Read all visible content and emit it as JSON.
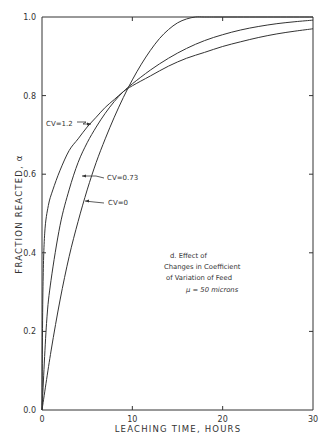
{
  "chart_data": {
    "type": "line",
    "title": "",
    "xlabel": "LEACHING TIME, HOURS",
    "ylabel": "FRACTION REACTED, α",
    "xlim": [
      0,
      30
    ],
    "ylim": [
      0.0,
      1.0
    ],
    "x_ticks": [
      "0",
      "10",
      "20",
      "30"
    ],
    "y_ticks": [
      "0.0",
      "0.2",
      "0.4",
      "0.6",
      "0.8",
      "1.0"
    ],
    "grid": false,
    "legend": "inline labels with arrows",
    "annotation": {
      "line1": "d. Effect of",
      "line2": "Changes in Coefficient",
      "line3": "of Variation of Feed",
      "line4": "μ = 50 microns"
    },
    "series": [
      {
        "name": "CV=1.2",
        "x": [
          0,
          0.1,
          0.3,
          0.7,
          1.2,
          2,
          3,
          4,
          5,
          6,
          7,
          8,
          9,
          10,
          12,
          14,
          16,
          18,
          20,
          22,
          24,
          26,
          28,
          30
        ],
        "y": [
          0,
          0.3,
          0.45,
          0.52,
          0.56,
          0.61,
          0.66,
          0.69,
          0.72,
          0.745,
          0.77,
          0.79,
          0.81,
          0.825,
          0.85,
          0.875,
          0.895,
          0.91,
          0.925,
          0.937,
          0.948,
          0.957,
          0.964,
          0.97
        ]
      },
      {
        "name": "CV=0.73",
        "x": [
          0,
          0.5,
          1,
          2,
          3,
          4,
          5,
          6,
          7,
          8,
          9,
          10,
          12,
          14,
          16,
          18,
          20,
          22,
          24,
          26,
          28,
          30
        ],
        "y": [
          0,
          0.22,
          0.33,
          0.47,
          0.56,
          0.63,
          0.68,
          0.72,
          0.755,
          0.785,
          0.81,
          0.83,
          0.865,
          0.895,
          0.92,
          0.94,
          0.955,
          0.967,
          0.976,
          0.983,
          0.988,
          0.992
        ]
      },
      {
        "name": "CV=0",
        "x": [
          0,
          1,
          2,
          3,
          4,
          5,
          6,
          7,
          8,
          9,
          10,
          11,
          12,
          13,
          14,
          15,
          16,
          17,
          18,
          20,
          25,
          30
        ],
        "y": [
          0,
          0.15,
          0.28,
          0.39,
          0.48,
          0.56,
          0.63,
          0.69,
          0.745,
          0.795,
          0.84,
          0.88,
          0.915,
          0.945,
          0.968,
          0.985,
          0.995,
          1.0,
          1.0,
          1.0,
          1.0,
          1.0
        ]
      }
    ]
  },
  "labels": {
    "cv12": "CV=1.2",
    "cv073": "CV=0.73",
    "cv0": "CV=0"
  }
}
